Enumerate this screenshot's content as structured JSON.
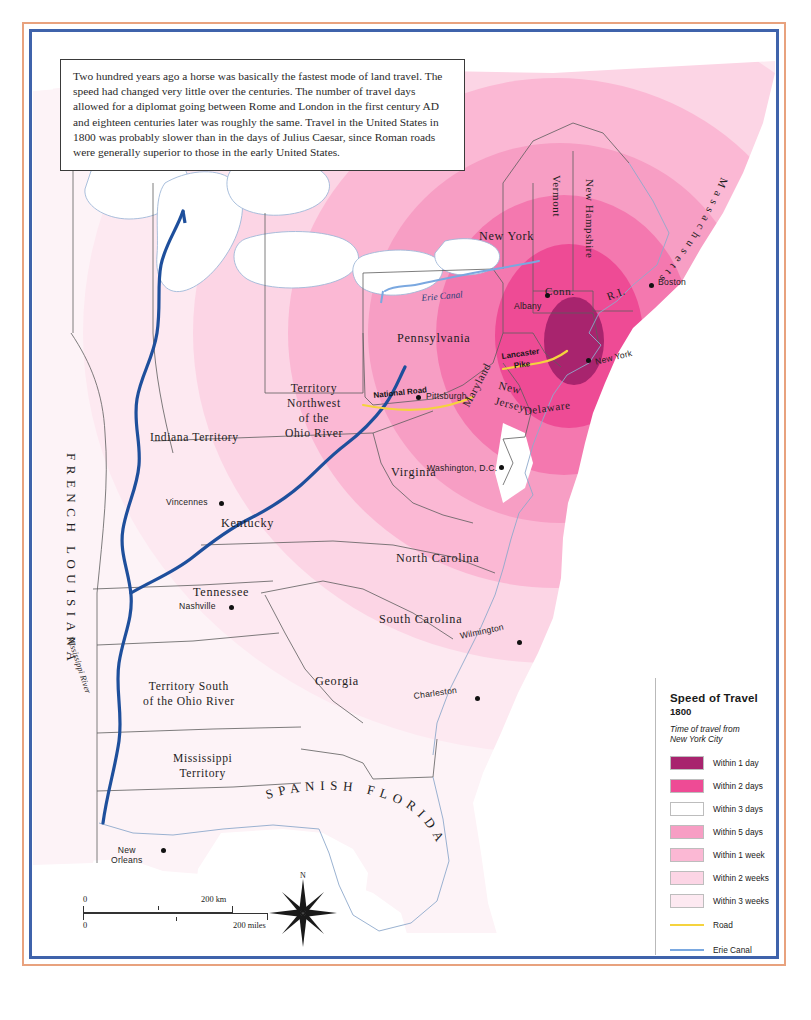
{
  "caption": {
    "text": "Two hundred years ago a horse was basically the fastest mode of land travel. The speed had changed very little over the centuries. The number of travel days allowed for a diplomat going between Rome and London in the first century AD and eighteen centuries later was roughly the same. Travel in the United States in 1800 was probably slower than in the days of Julius Caesar, since Roman roads were generally superior to those in the early United States."
  },
  "legend": {
    "title": "Speed of Travel",
    "year": "1800",
    "subtitle": "Time of travel from\nNew York City",
    "swatches": [
      {
        "label": "Within 1 day",
        "color": "#a8246e"
      },
      {
        "label": "Within 2 days",
        "color": "#ee4b95"
      },
      {
        "label": "Within 3 days",
        "color": "#f островf"
      },
      {
        "label": "Within 5 days",
        "color": "#f79ec4"
      },
      {
        "label": "Within 1 week",
        "color": "#fbb8d4"
      },
      {
        "label": "Within 2 weeks",
        "color": "#fcd5e5"
      },
      {
        "label": "Within 3 weeks",
        "color": "#fde9f1"
      }
    ],
    "lines": [
      {
        "label": "Road",
        "color": "#f5d33d",
        "width": "2px"
      },
      {
        "label": "Erie Canal",
        "color": "#7aa8e0",
        "width": "2px"
      },
      {
        "label": "Steamboat",
        "color": "#1e4f9c",
        "width": "5px"
      }
    ]
  },
  "map": {
    "states": [
      {
        "name": "New York",
        "x": 446,
        "y": 196
      },
      {
        "name": "Pennsylvania",
        "x": 364,
        "y": 298
      },
      {
        "name": "Virginia",
        "x": 358,
        "y": 432
      },
      {
        "name": "Kentucky",
        "x": 188,
        "y": 483
      },
      {
        "name": "Tennessee",
        "x": 160,
        "y": 552
      },
      {
        "name": "North Carolina",
        "x": 363,
        "y": 518
      },
      {
        "name": "South Carolina",
        "x": 346,
        "y": 582
      },
      {
        "name": "Georgia",
        "x": 282,
        "y": 641
      },
      {
        "name": "Maryland",
        "x": 441,
        "y": 385
      },
      {
        "name": "Delaware",
        "x": 500,
        "y": 375
      },
      {
        "name": "New\nJersey",
        "x": 475,
        "y": 360
      },
      {
        "name": "Vermont",
        "x": 521,
        "y": 170
      },
      {
        "name": "New Hampshire",
        "x": 554,
        "y": 173
      },
      {
        "name": "Conn.",
        "x": 519,
        "y": 285
      },
      {
        "name": "R.I.",
        "x": 578,
        "y": 291
      },
      {
        "name": "Massachusetts",
        "x": 0,
        "y": 0
      }
    ],
    "territories": [
      {
        "name": "Indiana Territory",
        "x": 117,
        "y": 397
      },
      {
        "name": "Territory\nNorthwest\nof the\nOhio River",
        "x": 252,
        "y": 354
      },
      {
        "name": "Territory South\nof the Ohio River",
        "x": 120,
        "y": 650
      },
      {
        "name": "Mississippi\nTerritory",
        "x": 140,
        "y": 722
      },
      {
        "name": "FRENCH LOUISIANA",
        "x": 55,
        "y": 430
      },
      {
        "name": "SPANISH FLORIDA",
        "x": 260,
        "y": 760
      }
    ],
    "cities": [
      {
        "name": "Albany",
        "x": 512,
        "y": 260,
        "dx": 22,
        "dy": 6
      },
      {
        "name": "Boston",
        "x": 616,
        "y": 250,
        "dx": 9,
        "dy": 0
      },
      {
        "name": "New York",
        "x": 553,
        "y": 325,
        "dx": 10,
        "dy": 2
      },
      {
        "name": "Pittsburgh",
        "x": 383,
        "y": 362,
        "dx": 10,
        "dy": 0
      },
      {
        "name": "Washington, D.C.",
        "x": 466,
        "y": 432,
        "dx": -72,
        "dy": 2
      },
      {
        "name": "Wilmington",
        "x": 484,
        "y": 607,
        "dx": -58,
        "dy": -5
      },
      {
        "name": "Charleston",
        "x": 442,
        "y": 663,
        "dx": -62,
        "dy": 0
      },
      {
        "name": "Nashville",
        "x": 196,
        "y": 572,
        "dx": -50,
        "dy": 0
      },
      {
        "name": "Vincennes",
        "x": 186,
        "y": 468,
        "dx": -53,
        "dy": 0
      },
      {
        "name": "New\nOrleans",
        "x": 128,
        "y": 815,
        "dx": -46,
        "dy": -4
      }
    ],
    "routes": [
      {
        "name": "National Road",
        "x": 380,
        "y": 383
      },
      {
        "name": "Lancaster\nPike",
        "x": 500,
        "y": 352
      },
      {
        "name": "Erie Canal",
        "x": 424,
        "y": 272
      },
      {
        "name": "Mississippi River",
        "x": 70,
        "y": 630
      }
    ],
    "compass": {
      "label": "N",
      "x": 290,
      "y": 865
    },
    "scale": {
      "km_zero": "0",
      "km_max": "200 km",
      "mi_zero": "0",
      "mi_max": "200 miles"
    }
  }
}
